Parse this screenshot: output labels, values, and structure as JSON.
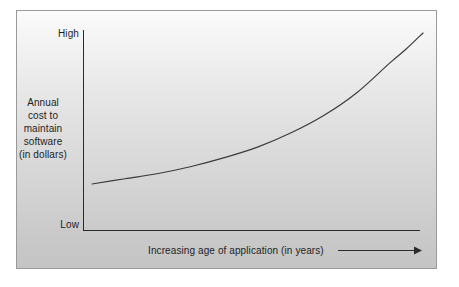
{
  "chart_data": {
    "type": "line",
    "title": "",
    "subtitle": "",
    "xlabel": "Increasing age of application (in years)",
    "ylabel": "Annual cost to maintain software (in dollars)",
    "ylabel_lines": [
      "Annual",
      "cost to",
      "maintain",
      "software",
      "(in dollars)"
    ],
    "ytick_labels": [
      "High",
      "Low"
    ],
    "xtick_labels": [],
    "ylim": [
      "Low",
      "High"
    ],
    "xlim": [
      "0",
      "increasing"
    ],
    "grid": false,
    "legend": false,
    "legend_position": "none",
    "axis_arrow": true,
    "series": [
      {
        "name": "Annual maintenance cost",
        "description": "Exponentially increasing cost of maintaining software as the application ages",
        "x": [
          0,
          10,
          20,
          30,
          40,
          50,
          60,
          70,
          80,
          90,
          95,
          100
        ],
        "y": [
          14,
          17,
          20,
          24,
          29,
          35,
          43,
          53,
          66,
          83,
          91,
          100
        ]
      }
    ],
    "annotations": []
  },
  "labels": {
    "ytick_high": "High",
    "ytick_low": "Low",
    "yaxis_title_lines": [
      "Annual",
      "cost to",
      "maintain",
      "software",
      "(in dollars)"
    ],
    "xaxis_title": "Increasing age of application (in years)"
  },
  "colors": {
    "curve": "#3a3a3a",
    "axis": "#2b2b2b",
    "text": "#1e1e1e",
    "panel_border": "#9a9a9a",
    "panel_top": "#fbfbfb",
    "panel_bottom": "#c4c4c4",
    "page_background": "#ffffff"
  }
}
